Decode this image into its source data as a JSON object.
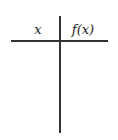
{
  "table": {
    "columns": [
      {
        "label": "x"
      },
      {
        "label": "f(x)"
      }
    ],
    "rows": []
  },
  "colors": {
    "line": "#333333",
    "text": "#222222",
    "background": "#ffffff"
  }
}
